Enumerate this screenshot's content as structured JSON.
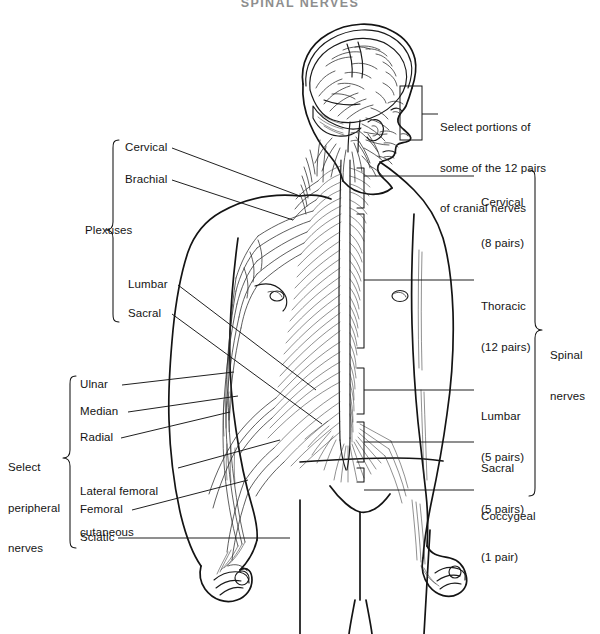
{
  "figure": {
    "title": "SPINAL NERVES",
    "width": 600,
    "height": 634,
    "ink_color": "#141414",
    "background": "#ffffff"
  },
  "callouts": {
    "cranial_nerves": {
      "line1": "Select portions of",
      "line2": "some of the 12 pairs",
      "line3": "of cranial nerves"
    }
  },
  "left_groups": [
    {
      "group_label": "Plexuses",
      "items": [
        {
          "label": "Cervical"
        },
        {
          "label": "Brachial"
        },
        {
          "label": "Lumbar"
        },
        {
          "label": "Sacral"
        }
      ]
    },
    {
      "group_label_line1": "Select",
      "group_label_line2": "peripheral",
      "group_label_line3": "nerves",
      "items": [
        {
          "label": "Ulnar"
        },
        {
          "label": "Median"
        },
        {
          "label": "Radial"
        },
        {
          "label": "Lateral femoral",
          "label2": "cutaneous"
        },
        {
          "label": "Femoral"
        },
        {
          "label": "Sciatic"
        }
      ]
    }
  ],
  "right_group": {
    "group_label_line1": "Spinal",
    "group_label_line2": "nerves",
    "items": [
      {
        "region": "Cervical",
        "count": "(8 pairs)"
      },
      {
        "region": "Thoracic",
        "count": "(12 pairs)"
      },
      {
        "region": "Lumbar",
        "count": "(5 pairs)"
      },
      {
        "region": "Sacral",
        "count": "(5 pairs)"
      },
      {
        "region": "Coccygeal",
        "count": "(1 pair)"
      }
    ]
  },
  "anatomy": {
    "view": "posterior-lateral human figure with head in right profile",
    "structures": [
      "brain",
      "cranial-nerves",
      "spinal-cord",
      "spinal-nerve-roots",
      "cervical-plexus",
      "brachial-plexus",
      "lumbar-plexus",
      "sacral-plexus",
      "ulnar-nerve",
      "median-nerve",
      "radial-nerve",
      "lateral-femoral-cutaneous-nerve",
      "femoral-nerve",
      "sciatic-nerve"
    ]
  }
}
